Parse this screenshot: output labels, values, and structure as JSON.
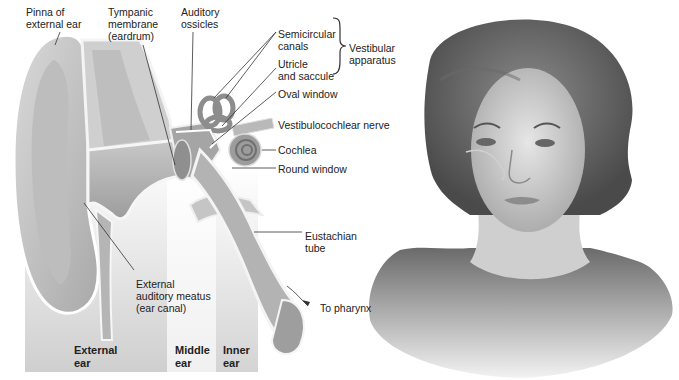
{
  "diagram": {
    "labels": {
      "pinna": [
        "Pinna of",
        "external ear"
      ],
      "tympanic": [
        "Tympanic",
        "membrane",
        "(eardrum)"
      ],
      "ossicles": [
        "Auditory",
        "ossicles"
      ],
      "semicircular": [
        "Semicircular",
        "canals"
      ],
      "utricle": [
        "Utricle",
        "and saccule"
      ],
      "vestibular": [
        "Vestibular",
        "apparatus"
      ],
      "oval_window": "Oval window",
      "vestibulocochlear": "Vestibulocochlear nerve",
      "cochlea": "Cochlea",
      "round_window": "Round window",
      "eustachian": [
        "Eustachian",
        "tube"
      ],
      "meatus": [
        "External",
        "auditory meatus",
        "(ear canal)"
      ],
      "pharynx": "To pharynx"
    },
    "regions": {
      "external": [
        "External",
        "ear"
      ],
      "middle": [
        "Middle",
        "ear"
      ],
      "inner": [
        "Inner",
        "ear"
      ]
    },
    "colors": {
      "region_external": "#c9c9c9",
      "region_middle": "#efefef",
      "region_inner": "#d8d8d8",
      "tissue": "#b4b4b4",
      "tissue_light": "#d6d6d6",
      "leader": "#333333"
    }
  }
}
